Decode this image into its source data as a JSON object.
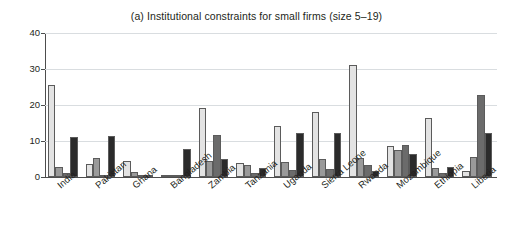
{
  "chart_data": {
    "type": "bar",
    "title": "(a) Institutional constraints for small firms (size 5–19)",
    "xlabel": "",
    "ylabel": "",
    "ylim": [
      0,
      40
    ],
    "yticks": [
      0,
      10,
      20,
      30,
      40
    ],
    "grid": true,
    "legend": "none",
    "categories": [
      "India",
      "Pakistan",
      "Ghana",
      "Bangladesh",
      "Zambia",
      "Tanzania",
      "Uganda",
      "Sierra Leone",
      "Rwanda",
      "Mozambique",
      "Ethiopia",
      "Liberia"
    ],
    "series": [
      {
        "name": "series-1",
        "color": "#e3e3e3",
        "values": [
          25.5,
          3.5,
          4.5,
          0.4,
          19.3,
          3.8,
          14.3,
          18.0,
          31.0,
          8.6,
          16.5,
          1.8
        ]
      },
      {
        "name": "series-2",
        "color": "#9a9a9a",
        "values": [
          2.8,
          5.4,
          1.5,
          0.5,
          4.4,
          3.2,
          4.3,
          5.0,
          5.4,
          7.5,
          2.4,
          5.5
        ]
      },
      {
        "name": "series-3",
        "color": "#6b6b6b",
        "values": [
          1.0,
          0.6,
          0.5,
          0.3,
          11.8,
          1.1,
          2.0,
          2.2,
          3.3,
          9.0,
          1.0,
          22.8
        ]
      },
      {
        "name": "series-4",
        "color": "#2b2b2b",
        "values": [
          11.0,
          11.3,
          0.4,
          7.8,
          5.0,
          2.5,
          12.2,
          12.2,
          1.8,
          6.3,
          2.8,
          12.2
        ]
      }
    ]
  },
  "axis": {
    "tick_labels": [
      "0",
      "10",
      "20",
      "30",
      "40"
    ]
  },
  "colors": {
    "grid": "#d9dde0",
    "axis": "#4d4d4d",
    "text": "#231f20",
    "background": "#ffffff"
  }
}
